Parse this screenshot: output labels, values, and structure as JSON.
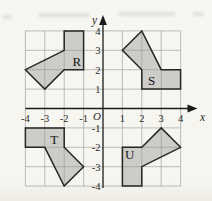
{
  "figure": {
    "background_color": "#f6f5f0",
    "axes": {
      "x_label": "x",
      "y_label": "y",
      "origin_label": "O",
      "grid_min": -4,
      "grid_max": 4,
      "x_tick_values": [
        -4,
        -3,
        -2,
        -1,
        1,
        2,
        3,
        4
      ],
      "x_tick_labels": [
        "-4",
        "-3",
        "-2",
        "-1",
        "1",
        "2",
        "3",
        "4"
      ],
      "y_tick_values": [
        4,
        3,
        2,
        1,
        -1,
        -2,
        -3,
        -4
      ],
      "y_tick_labels": [
        "4",
        "3",
        "2",
        "1",
        "-1",
        "-2",
        "-3",
        "-4"
      ],
      "axis_color": "#1b1b1b",
      "grid_color": "#a1a3a4",
      "tick_color": "#2a2a2a"
    },
    "shapes": [
      {
        "label": "R",
        "vertices": [
          [
            -2,
            4
          ],
          [
            -1,
            4
          ],
          [
            -1,
            2
          ],
          [
            -2,
            2
          ],
          [
            -3,
            1
          ],
          [
            -4,
            2
          ],
          [
            -2,
            3
          ]
        ],
        "label_pos": [
          -1.35,
          2.42
        ]
      },
      {
        "label": "S",
        "vertices": [
          [
            4,
            2
          ],
          [
            4,
            1
          ],
          [
            2,
            1
          ],
          [
            2,
            2
          ],
          [
            1,
            3
          ],
          [
            2,
            4
          ],
          [
            3,
            2
          ]
        ],
        "label_pos": [
          2.5,
          1.45
        ]
      },
      {
        "label": "T",
        "vertices": [
          [
            -4,
            -1
          ],
          [
            -2,
            -1
          ],
          [
            -2,
            -2
          ],
          [
            -1,
            -3
          ],
          [
            -2,
            -4
          ],
          [
            -3,
            -2
          ],
          [
            -4,
            -2
          ]
        ],
        "label_pos": [
          -2.52,
          -1.58
        ]
      },
      {
        "label": "U",
        "vertices": [
          [
            1,
            -2
          ],
          [
            2,
            -2
          ],
          [
            3,
            -1
          ],
          [
            4,
            -2
          ],
          [
            2,
            -3
          ],
          [
            2,
            -4
          ],
          [
            1,
            -4
          ]
        ],
        "label_pos": [
          1.38,
          -2.35
        ]
      }
    ],
    "shape_fill": "rgba(148,148,148,0.42)",
    "shape_stroke": "#262626",
    "shape_label_color": "#141414"
  }
}
